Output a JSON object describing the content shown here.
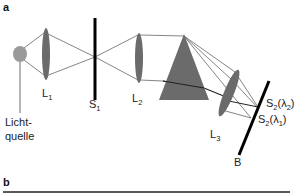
{
  "figure": {
    "panels": [
      {
        "id": "a",
        "label": "a"
      },
      {
        "id": "b",
        "label": "b"
      }
    ],
    "components": {
      "light_source": {
        "label_line1": "Licht-",
        "label_line2": "quelle"
      },
      "lens1": {
        "base": "L",
        "sub": "1"
      },
      "slit1": {
        "base": "S",
        "sub": "1"
      },
      "lens2": {
        "base": "L",
        "sub": "2"
      },
      "prism": {
        "name": "prism"
      },
      "lens3": {
        "base": "L",
        "sub": "3"
      },
      "screen": {
        "label": "B"
      },
      "image_lambda2": {
        "base": "S",
        "sub": "2",
        "paren_open": "(λ",
        "lambda_sub": "2",
        "paren_close": ")"
      },
      "image_lambda1": {
        "base": "S",
        "sub": "2",
        "paren_open": "(λ",
        "lambda_sub": "1",
        "paren_close": ")"
      }
    },
    "colors": {
      "element_fill": "#6b6b6b",
      "source_fill": "#9a9a9a",
      "ray": "#555555",
      "slit": "#000000"
    }
  }
}
